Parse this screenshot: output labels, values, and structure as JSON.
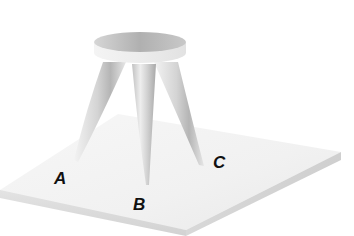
{
  "diagram": {
    "labels": {
      "leg_a": "A",
      "leg_b": "B",
      "leg_c": "C"
    },
    "colors": {
      "background": "#ffffff",
      "platform_top": "#f2f2f2",
      "platform_edge": "#d9d9d9",
      "seat_top": "#bdbdbd",
      "seat_side": "#efefef",
      "leg_light": "#f0f0f0",
      "leg_dark": "#b8b8b8",
      "label_text": "#111111"
    }
  }
}
